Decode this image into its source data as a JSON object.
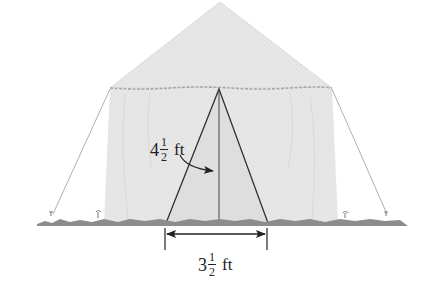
{
  "figure": {
    "colors": {
      "background": "#ffffff",
      "tent_fabric": "#e6e6e6",
      "tent_roof": "#e2e2e2",
      "tent_edge": "#b0b0b0",
      "ground": "#8c8c8c",
      "lines": "#333333",
      "rope": "#a6a6a6",
      "text": "#222222"
    }
  },
  "labels": {
    "height": {
      "whole": "4",
      "numerator": "1",
      "denominator": "2",
      "unit": "ft"
    },
    "base": {
      "whole": "3",
      "numerator": "1",
      "denominator": "2",
      "unit": "ft"
    }
  }
}
